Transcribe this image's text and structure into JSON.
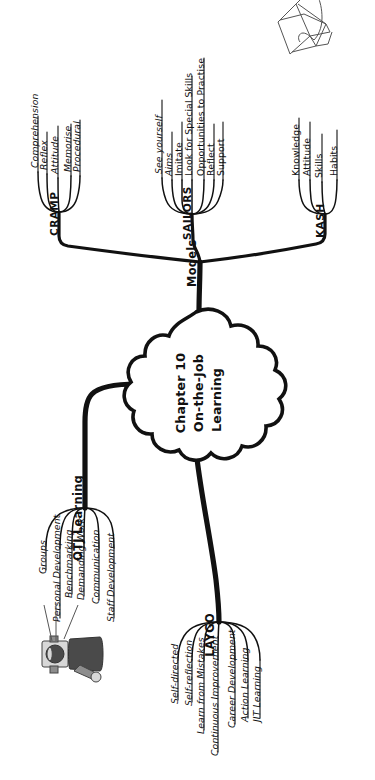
{
  "diagram": {
    "orientation": "rotated-90-ccw",
    "ink_color": "#111111",
    "background_color": "#ffffff"
  },
  "core": {
    "name": "center-node",
    "line1": "Chapter 10",
    "line2": "On-the-Job",
    "line3": "Learning"
  },
  "branches": [
    {
      "id": "models",
      "label": "Models",
      "children": [
        {
          "id": "cramp",
          "label": "CRAMP",
          "items": [
            "Comprehension",
            "Reflex",
            "Attitude",
            "Memorise",
            "Procedural"
          ]
        },
        {
          "id": "sailors",
          "label": "SAILORS",
          "items": [
            "See yourself",
            "Aims",
            "Imitate",
            "Look for Special Skills",
            "Opportunities to Practise",
            "Reflect",
            "Support"
          ]
        },
        {
          "id": "kash",
          "label": "KASH",
          "items": [
            "Knowledge",
            "Attitude",
            "Skills",
            "Habits"
          ]
        }
      ]
    },
    {
      "id": "otj-learning",
      "label": "OTJ Learning",
      "items": [
        "Groups",
        "Personal Development",
        "Benchmarking",
        "Demanding Work",
        "Communication",
        "Staff Development"
      ]
    },
    {
      "id": "laygo",
      "label": "LAYGO",
      "items": [
        "Self-directed",
        "Self-reflection",
        "Learn from Mistakes",
        "Continuous Improvement",
        "Career Development",
        "Action Learning",
        "JIT Learning"
      ]
    }
  ],
  "illustrations": [
    {
      "id": "graduation-cap",
      "name": "graduation-cap-book-icon",
      "description": "Mortarboard graduation cap resting on an open book with tassel"
    },
    {
      "id": "presenter-person",
      "name": "presenter-person-icon",
      "description": "Person gesturing toward the mind map"
    }
  ]
}
